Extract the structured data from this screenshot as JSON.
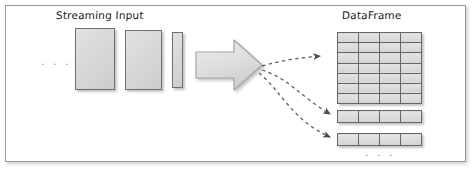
{
  "figure": {
    "title_left": "Streaming Input",
    "title_right": "DataFrame",
    "ellipsis_left": ". . .",
    "ellipsis_bottom": ". . .",
    "border_color": "#9a9a9a",
    "background": "#ffffff"
  },
  "streaming_input": {
    "label": "Streaming Input",
    "fill_color": "#d7d7d7",
    "stroke_color": "#6f6f6f",
    "blocks": [
      {
        "name": "stream-block-1",
        "x": 75,
        "y": 28,
        "width": 40,
        "height": 62
      },
      {
        "name": "stream-block-2",
        "x": 125,
        "y": 30,
        "width": 37,
        "height": 60
      },
      {
        "name": "stream-block-3",
        "x": 172,
        "y": 32,
        "width": 11,
        "height": 56
      }
    ]
  },
  "transform_arrow": {
    "name": "block-arrow",
    "direction": "right",
    "fill_color": "#dcdcdc",
    "stroke_color": "#9e9e9e"
  },
  "dashed_arrows": {
    "count": 3,
    "style": "dashed-curved",
    "color": "#6d6d6d",
    "targets": [
      "dataframe-grid",
      "dataframe-row-1",
      "dataframe-row-2"
    ]
  },
  "dataframe": {
    "label": "DataFrame",
    "cell_fill": "#dcdcdc",
    "cell_stroke": "#666666",
    "grid": {
      "name": "dataframe-grid",
      "columns": 4,
      "rows": 7
    },
    "extra_rows": [
      {
        "name": "dataframe-row-1",
        "columns": 4
      },
      {
        "name": "dataframe-row-2",
        "columns": 4
      }
    ],
    "ellipsis": ". . ."
  }
}
